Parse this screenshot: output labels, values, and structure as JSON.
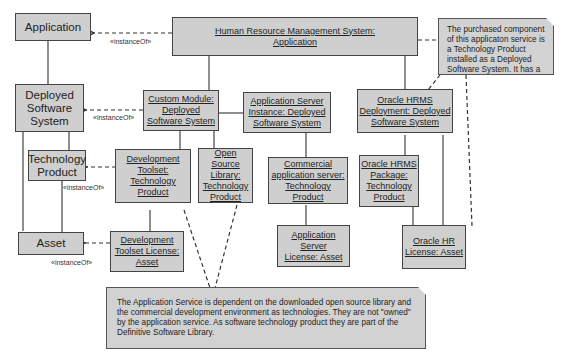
{
  "classes": {
    "application": "Application",
    "deployed_software_system": [
      "Deployed",
      "Software",
      "System"
    ],
    "technology_product": [
      "Technology",
      "Product"
    ],
    "asset": "Asset"
  },
  "instances": {
    "hrms": [
      "Human Resource Management System:",
      "Application"
    ],
    "custom_module": [
      "Custom Module:",
      "Deployed",
      "Software System"
    ],
    "app_server_instance": [
      "Application Server",
      "Instance:  Deployed",
      "Software System"
    ],
    "oracle_hrms_deployment": [
      "Oracle  HRMS",
      "Deployment: Deployed",
      "Software  System"
    ],
    "dev_toolset": [
      "Development",
      "Toolset:",
      "Technology",
      "Product"
    ],
    "open_source_library": [
      "Open Source",
      "Library:",
      "Technology",
      "Product"
    ],
    "commercial_app_server": [
      "Commercial",
      "application server:",
      "Technology Product"
    ],
    "oracle_hrms_package": [
      "Oracle HRMS",
      "Package:",
      "Technology",
      "Product"
    ],
    "dev_toolset_license": [
      "Development",
      "Toolset  License:",
      "Asset"
    ],
    "app_server_license": [
      "Application  Server",
      "License: Asset"
    ],
    "oracle_hr_license": [
      "Oracle HR",
      "License: Asset"
    ]
  },
  "stereotype": "«instanceOf»",
  "notes": {
    "top_right": "The purchased component of this applicaton service is a Technology Product installed as a Deployed Software System. It has a license and is therefore an Asset as well.",
    "bottom": "The  Application Service is dependent on the downloaded open source library and the commercial development environment as technologies. They are not \"owned\" by the application service. As software technology product they are part of the Definitive Software Library."
  }
}
